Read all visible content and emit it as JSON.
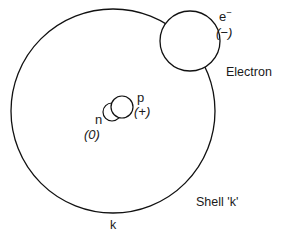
{
  "figure": {
    "background_color": "#ffffff",
    "stroke_color": "#111111"
  },
  "shell": {
    "label": "Shell 'k'",
    "shell_letter": "k",
    "center_x": 113,
    "center_y": 111,
    "radius": 102,
    "stroke_width": 1.3
  },
  "electron": {
    "name_label": "Electron",
    "symbol": "e",
    "symbol_superscript": "−",
    "charge_label": "(−)",
    "center_x": 190,
    "center_y": 41,
    "radius": 30,
    "stroke_width": 1.3
  },
  "nucleus": {
    "neutron": {
      "symbol": "n",
      "charge_label": "(0)",
      "center_x": 112,
      "center_y": 112,
      "radius": 9,
      "stroke_width": 1.2
    },
    "proton": {
      "symbol": "p",
      "charge_label": "(+)",
      "center_x": 122,
      "center_y": 107,
      "radius": 11,
      "stroke_width": 1.2
    }
  }
}
